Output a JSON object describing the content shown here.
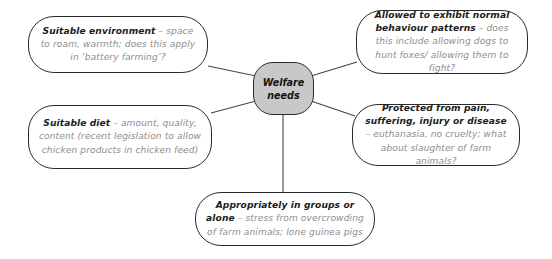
{
  "diagram": {
    "center": {
      "label_line1": "Welfare",
      "label_line2": "needs",
      "fill_color": "#c8c8c8",
      "stroke_color": "#2b2b2b"
    },
    "node_text_color": "#8d8d8d",
    "node_bold_color": "#1c1c1c",
    "background_color": "#ffffff",
    "branches": [
      {
        "id": "environment",
        "position": "top-left",
        "bold": "Suitable environment",
        "rest": " – space to roam, warmth; does this apply in ‘battery farming’?"
      },
      {
        "id": "diet",
        "position": "bottom-left",
        "bold": "Suitable diet",
        "rest": " – amount, quality, content (recent legislation to allow chicken products in chicken feed)"
      },
      {
        "id": "behaviour",
        "position": "top-right",
        "bold": "Allowed to exhibit normal behaviour patterns",
        "rest": " – does this include allowing dogs to hunt foxes/ allowing them to fight?"
      },
      {
        "id": "protection",
        "position": "bottom-right",
        "bold": "Protected from pain, suffering, injury or disease",
        "rest": " – euthanasia, no cruelty; what about slaughter of farm animals?"
      },
      {
        "id": "grouping",
        "position": "bottom-center",
        "bold": "Appropriately in groups or alone",
        "rest": " – stress from overcrowding of farm animals; lone guinea pigs"
      }
    ]
  }
}
